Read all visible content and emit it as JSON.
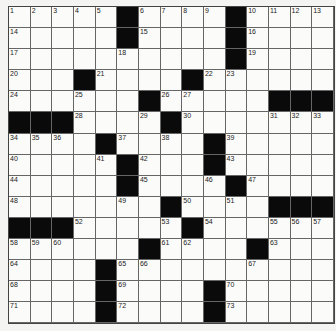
{
  "puzzle": {
    "rows": 15,
    "cols": 15,
    "grid": [
      [
        "1",
        "2",
        "3",
        "4",
        "5",
        "#",
        "6",
        "7",
        "8",
        "9",
        "#",
        "10",
        "11",
        "12",
        "13"
      ],
      [
        "14",
        "",
        "",
        "",
        "",
        "#",
        "15",
        "",
        "",
        "",
        "#",
        "16",
        "",
        "",
        ""
      ],
      [
        "17",
        "",
        "",
        "",
        "",
        "18",
        "",
        "",
        "",
        "",
        "#",
        "19",
        "",
        "",
        ""
      ],
      [
        "20",
        "",
        "",
        "#",
        "21",
        "",
        "",
        "",
        "#",
        "22",
        "23",
        "",
        "",
        "",
        ""
      ],
      [
        "24",
        "",
        "",
        "25",
        "",
        "",
        "#",
        "26",
        "27",
        "",
        "",
        "",
        "#",
        "#",
        "#"
      ],
      [
        "#",
        "#",
        "#",
        "28",
        "",
        "",
        "29",
        "#",
        "30",
        "",
        "",
        "",
        "31",
        "32",
        "33"
      ],
      [
        "34",
        "35",
        "36",
        "",
        "#",
        "37",
        "",
        "38",
        "",
        "#",
        "39",
        "",
        "",
        "",
        ""
      ],
      [
        "40",
        "",
        "",
        "",
        "41",
        "#",
        "42",
        "",
        "",
        "#",
        "43",
        "",
        "",
        "",
        ""
      ],
      [
        "44",
        "",
        "",
        "",
        "",
        "#",
        "45",
        "",
        "",
        "46",
        "#",
        "47",
        "",
        "",
        ""
      ],
      [
        "48",
        "",
        "",
        "",
        "",
        "49",
        "",
        "#",
        "50",
        "",
        "51",
        "",
        "#",
        "#",
        "#"
      ],
      [
        "#",
        "#",
        "#",
        "52",
        "",
        "",
        "",
        "53",
        "#",
        "54",
        "",
        "",
        "55",
        "56",
        "57"
      ],
      [
        "58",
        "59",
        "60",
        "",
        "",
        "",
        "#",
        "61",
        "62",
        "",
        "",
        "#",
        "63",
        "",
        ""
      ],
      [
        "64",
        "",
        "",
        "",
        "#",
        "65",
        "66",
        "",
        "",
        "",
        "",
        "67",
        "",
        "",
        ""
      ],
      [
        "68",
        "",
        "",
        "",
        "#",
        "69",
        "",
        "",
        "",
        "#",
        "70",
        "",
        "",
        "",
        ""
      ],
      [
        "71",
        "",
        "",
        "",
        "#",
        "72",
        "",
        "",
        "",
        "#",
        "73",
        "",
        "",
        "",
        ""
      ]
    ]
  },
  "colors": {
    "black_square": "#0a0a0a",
    "white_square": "#fbfbf9",
    "grid_line": "#666666"
  }
}
